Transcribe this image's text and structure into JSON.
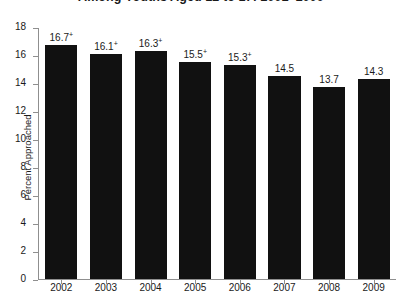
{
  "chart_data": {
    "type": "bar",
    "title_line_1": "",
    "title_line_2": "Among Youths Aged 12 to 17: 2002–2009",
    "categories": [
      "2002",
      "2003",
      "2004",
      "2005",
      "2006",
      "2007",
      "2008",
      "2009"
    ],
    "values": [
      16.7,
      16.1,
      16.3,
      15.5,
      15.3,
      14.5,
      13.7,
      14.3
    ],
    "value_labels": [
      "16.7",
      "16.1",
      "16.3",
      "15.5",
      "15.3",
      "14.5",
      "13.7",
      "14.3"
    ],
    "value_markers": [
      "+",
      "+",
      "+",
      "+",
      "+",
      "",
      "",
      ""
    ],
    "xlabel": "",
    "ylabel": "Percent Approached",
    "ylim": [
      0,
      18
    ],
    "yticks": [
      18,
      16,
      14,
      12,
      10,
      8,
      6,
      4,
      2,
      0
    ],
    "grid": false,
    "legend": null,
    "bar_color": "#111111",
    "axis_color": "#8f8f8f",
    "text_color": "#1a1a1a",
    "background": "#ffffff"
  }
}
